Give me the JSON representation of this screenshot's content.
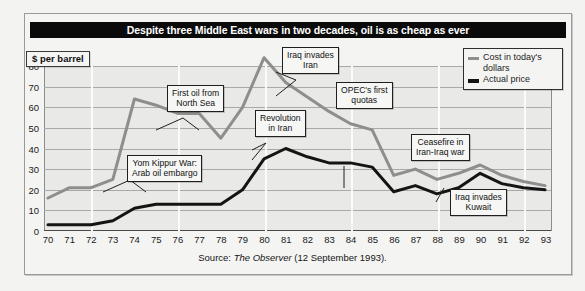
{
  "title": "Despite three Middle East wars in two decades, oil is as cheap as ever",
  "y_axis_unit_label": "$ per barrel",
  "source": {
    "prefix": "Source: ",
    "publication": "The Observer",
    "suffix": " (12 September 1993)."
  },
  "legend": {
    "position": "top-right",
    "items": [
      {
        "label_line1": "Cost in today's",
        "label_line2": "dollars",
        "color": "#8e8e8e"
      },
      {
        "label_line1": "Actual price",
        "label_line2": "",
        "color": "#141414"
      }
    ]
  },
  "annotations": [
    {
      "id": "yom-kippur",
      "line1": "Yom Kippur War:",
      "line2": "Arab oil embargo"
    },
    {
      "id": "north-sea",
      "line1": "First oil from",
      "line2": "North Sea"
    },
    {
      "id": "revolution-iran",
      "line1": "Revolution",
      "line2": "in Iran"
    },
    {
      "id": "iraq-invades-iran",
      "line1": "Iraq invades",
      "line2": "Iran"
    },
    {
      "id": "opec-quotas",
      "line1": "OPEC's first",
      "line2": "quotas"
    },
    {
      "id": "ceasefire",
      "line1": "Ceasefire in",
      "line2": "Iran-Iraq war"
    },
    {
      "id": "iraq-invades-kuwait",
      "line1": "Iraq invades",
      "line2": "Kuwait"
    }
  ],
  "chart_data": {
    "type": "line",
    "title": "Despite three Middle East wars in two decades, oil is as cheap as ever",
    "xlabel": "",
    "ylabel": "$ per barrel",
    "ylim": [
      0,
      80
    ],
    "yticks": [
      0,
      10,
      20,
      30,
      40,
      50,
      60,
      70,
      80
    ],
    "grid": "horizontal gridlines at every 10; white vertical gridlines every 4 years",
    "categories": [
      "70",
      "71",
      "72",
      "73",
      "74",
      "75",
      "76",
      "77",
      "78",
      "79",
      "80",
      "81",
      "82",
      "83",
      "84",
      "85",
      "86",
      "87",
      "88",
      "89",
      "90",
      "91",
      "92",
      "93"
    ],
    "x": [
      1970,
      1971,
      1972,
      1973,
      1974,
      1975,
      1976,
      1977,
      1978,
      1979,
      1980,
      1981,
      1982,
      1983,
      1984,
      1985,
      1986,
      1987,
      1988,
      1989,
      1990,
      1991,
      1992,
      1993
    ],
    "series": [
      {
        "name": "Cost in today's dollars",
        "color": "#8e8e8e",
        "values": [
          16,
          21,
          21,
          25,
          64,
          61,
          57,
          57,
          45,
          60,
          84,
          72,
          65,
          58,
          52,
          49,
          27,
          30,
          25,
          28,
          32,
          27,
          24,
          22
        ]
      },
      {
        "name": "Actual price",
        "color": "#141414",
        "values": [
          3,
          3,
          3,
          5,
          11,
          13,
          13,
          13,
          13,
          20,
          35,
          40,
          36,
          33,
          33,
          31,
          19,
          22,
          18,
          21,
          28,
          23,
          21,
          20
        ]
      }
    ],
    "annotations": [
      {
        "text": "Yom Kippur War: Arab oil embargo",
        "x": 1973
      },
      {
        "text": "First oil from North Sea",
        "x": 1976
      },
      {
        "text": "Revolution in Iran",
        "x": 1979
      },
      {
        "text": "Iraq invades Iran",
        "x": 1980
      },
      {
        "text": "OPEC's first quotas",
        "x": 1983
      },
      {
        "text": "Ceasefire in Iran-Iraq war",
        "x": 1988
      },
      {
        "text": "Iraq invades Kuwait",
        "x": 1990
      }
    ]
  }
}
